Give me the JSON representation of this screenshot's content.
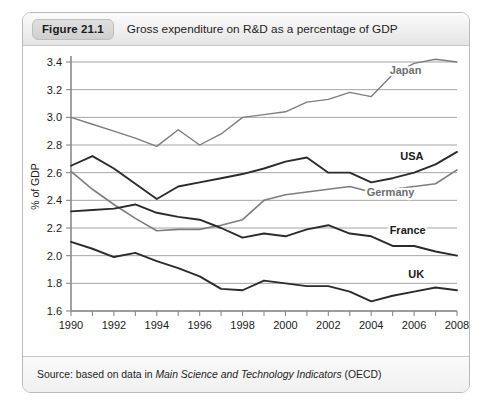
{
  "figure": {
    "badge": "Figure 21.1",
    "caption": "Gross expenditure on R&D as a percentage of GDP",
    "source_prefix": "Source: based on data in ",
    "source_italic": "Main Science and Technology Indicators",
    "source_suffix": " (OECD)"
  },
  "colors": {
    "dark_line": "#2b2b2b",
    "gray_line": "#7d7d7d",
    "gridline": "#9a9a9a",
    "axis": "#8a8a8a",
    "panel_border": "#b9b9b9",
    "header_bg": "#ececec",
    "badge_bg": "#d6d6d6",
    "text": "#1a1a1a"
  },
  "chart_data": {
    "type": "line",
    "title": "Gross expenditure on R&D as a percentage of GDP",
    "xlabel": "",
    "ylabel": "% of GDP",
    "xlim": [
      1990,
      2008
    ],
    "ylim": [
      1.6,
      3.4
    ],
    "yticks": [
      "1.6",
      "1.8",
      "2.0",
      "2.2",
      "2.4",
      "2.6",
      "2.8",
      "3.0",
      "3.2",
      "3.4"
    ],
    "xticks": [
      "1990",
      "1992",
      "1994",
      "1996",
      "1998",
      "2000",
      "2002",
      "2004",
      "2006",
      "2008"
    ],
    "x_minor_step": 1,
    "grid": "horizontal",
    "legend_position": "inline-right",
    "x": [
      1990,
      1991,
      1992,
      1993,
      1994,
      1995,
      1996,
      1997,
      1998,
      1999,
      2000,
      2001,
      2002,
      2003,
      2004,
      2005,
      2006,
      2007,
      2008
    ],
    "series": [
      {
        "name": "Japan",
        "color": "#7d7d7d",
        "label_color": "#6e6e6e",
        "width": 1.4,
        "label_x": 2005.6,
        "label_y": 3.31,
        "values": [
          3.0,
          2.95,
          2.9,
          2.85,
          2.79,
          2.91,
          2.8,
          2.88,
          3.0,
          3.02,
          3.04,
          3.11,
          3.13,
          3.18,
          3.15,
          3.31,
          3.39,
          3.42,
          3.4
        ]
      },
      {
        "name": "USA",
        "color": "#2b2b2b",
        "label_color": "#1a1a1a",
        "width": 1.9,
        "label_x": 2005.9,
        "label_y": 2.69,
        "values": [
          2.65,
          2.72,
          2.63,
          2.52,
          2.41,
          2.5,
          2.53,
          2.56,
          2.59,
          2.63,
          2.68,
          2.71,
          2.6,
          2.6,
          2.53,
          2.56,
          2.6,
          2.66,
          2.75
        ]
      },
      {
        "name": "Germany",
        "color": "#7d7d7d",
        "label_color": "#6e6e6e",
        "width": 1.6,
        "label_x": 2004.9,
        "label_y": 2.43,
        "values": [
          2.61,
          2.48,
          2.37,
          2.27,
          2.18,
          2.19,
          2.19,
          2.22,
          2.26,
          2.4,
          2.44,
          2.46,
          2.48,
          2.5,
          2.46,
          2.48,
          2.5,
          2.52,
          2.62
        ]
      },
      {
        "name": "France",
        "color": "#2b2b2b",
        "label_color": "#1a1a1a",
        "width": 1.9,
        "label_x": 2005.7,
        "label_y": 2.16,
        "values": [
          2.32,
          2.33,
          2.34,
          2.37,
          2.31,
          2.28,
          2.26,
          2.2,
          2.13,
          2.16,
          2.14,
          2.19,
          2.22,
          2.16,
          2.14,
          2.07,
          2.07,
          2.03,
          2.0
        ]
      },
      {
        "name": "UK",
        "color": "#2b2b2b",
        "label_color": "#1a1a1a",
        "width": 1.9,
        "label_x": 2006.1,
        "label_y": 1.84,
        "values": [
          2.1,
          2.05,
          1.99,
          2.02,
          1.96,
          1.91,
          1.85,
          1.76,
          1.75,
          1.82,
          1.8,
          1.78,
          1.78,
          1.74,
          1.67,
          1.71,
          1.74,
          1.77,
          1.75
        ]
      }
    ]
  }
}
